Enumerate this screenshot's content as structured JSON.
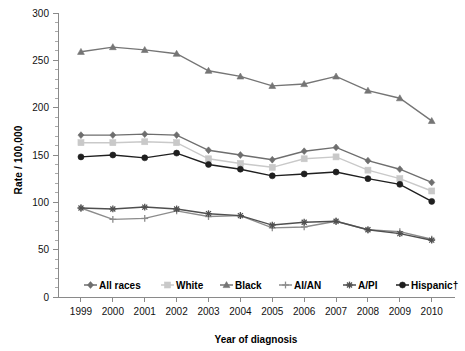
{
  "chart_data": {
    "type": "line",
    "title": "",
    "xlabel": "Year of diagnosis",
    "ylabel": "Rate / 100,000",
    "x": [
      1999,
      2000,
      2001,
      2002,
      2003,
      2004,
      2005,
      2006,
      2007,
      2008,
      2009,
      2010
    ],
    "categories": [
      "1999",
      "2000",
      "2001",
      "2002",
      "2003",
      "2004",
      "2005",
      "2006",
      "2007",
      "2008",
      "2009",
      "2010"
    ],
    "xlim": [
      1999,
      2010
    ],
    "ylim": [
      0,
      300
    ],
    "yticks": [
      0,
      50,
      100,
      150,
      200,
      250,
      300
    ],
    "ytick_labels": [
      "0",
      "50",
      "100",
      "150",
      "200",
      "250",
      "300"
    ],
    "y_minor_tick_step": 10,
    "grid": false,
    "legend_position": "bottom-inside",
    "series": [
      {
        "name": "All races",
        "color": "#6e6e6e",
        "marker": "diamond",
        "values": [
          171,
          171,
          172,
          171,
          155,
          150,
          145,
          154,
          158,
          144,
          135,
          121
        ]
      },
      {
        "name": "White",
        "color": "#c9c9c9",
        "marker": "square",
        "values": [
          163,
          163,
          164,
          163,
          146,
          141,
          137,
          146,
          148,
          134,
          125,
          112
        ]
      },
      {
        "name": "Black",
        "color": "#757575",
        "marker": "triangle",
        "values": [
          259,
          264,
          261,
          257,
          239,
          233,
          223,
          225,
          233,
          218,
          210,
          186
        ]
      },
      {
        "name": "AI/AN",
        "color": "#8c8c8c",
        "marker": "plus",
        "values": [
          94,
          82,
          83,
          91,
          85,
          86,
          73,
          74,
          80,
          71,
          69,
          61
        ]
      },
      {
        "name": "A/PI",
        "color": "#4f4f4f",
        "marker": "star",
        "values": [
          94,
          93,
          95,
          93,
          88,
          86,
          76,
          79,
          80,
          71,
          67,
          60
        ]
      },
      {
        "name": "Hispanic†",
        "color": "#1f1f1f",
        "marker": "circle",
        "values": [
          148,
          150,
          147,
          152,
          140,
          135,
          128,
          130,
          132,
          125,
          119,
          101
        ]
      }
    ]
  },
  "legend": {
    "items": [
      {
        "label": "All races"
      },
      {
        "label": "White"
      },
      {
        "label": "Black"
      },
      {
        "label": "AI/AN"
      },
      {
        "label": "A/PI"
      },
      {
        "label": "Hispanic†"
      }
    ]
  }
}
